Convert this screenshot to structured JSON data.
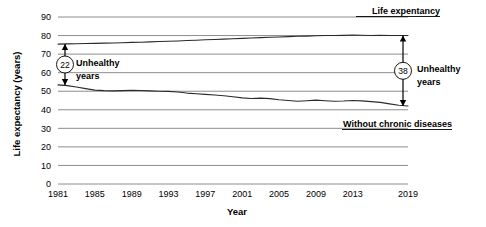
{
  "chart_data": {
    "type": "line",
    "title": "",
    "xlabel": "Year",
    "ylabel": "Life expectancy (years)",
    "xlim": [
      1981,
      2019
    ],
    "ylim": [
      0,
      90
    ],
    "grid": true,
    "legend_position": "inline-labels",
    "y_ticks": [
      0,
      10,
      20,
      30,
      40,
      50,
      60,
      70,
      80,
      90
    ],
    "x_ticks": [
      1981,
      1985,
      1989,
      1993,
      1997,
      2001,
      2005,
      2009,
      2013,
      2019
    ],
    "x_tick_labels": [
      "1981",
      "1985",
      "1989",
      "1993",
      "1997",
      "2001",
      "2005",
      "2009",
      "2013",
      "2019"
    ],
    "y_tick_labels": [
      "0",
      "10",
      "20",
      "30",
      "40",
      "50",
      "60",
      "70",
      "80",
      "90"
    ],
    "x": [
      1981,
      1982,
      1983,
      1984,
      1985,
      1986,
      1987,
      1988,
      1989,
      1990,
      1991,
      1992,
      1993,
      1994,
      1995,
      1996,
      1997,
      1998,
      1999,
      2000,
      2001,
      2002,
      2003,
      2004,
      2005,
      2006,
      2007,
      2008,
      2009,
      2010,
      2011,
      2012,
      2013,
      2014,
      2015,
      2016,
      2017,
      2018,
      2019
    ],
    "series": [
      {
        "name": "Life expentancy",
        "label": "Life expentancy",
        "color": "#2b2b2b",
        "values": [
          75.4,
          75.5,
          75.6,
          75.7,
          75.8,
          75.9,
          76.0,
          76.1,
          76.3,
          76.4,
          76.6,
          76.8,
          76.9,
          77.1,
          77.3,
          77.5,
          77.7,
          77.9,
          78.1,
          78.3,
          78.5,
          78.7,
          78.9,
          79.1,
          79.2,
          79.4,
          79.6,
          79.7,
          79.9,
          80.0,
          80.0,
          80.1,
          80.3,
          80.2,
          80.0,
          80.1,
          80.0,
          80.0,
          80.0
        ]
      },
      {
        "name": "Without chronic diseases",
        "label": "Without chronic diseases",
        "color": "#2b2b2b",
        "values": [
          53.4,
          53.0,
          52.3,
          51.4,
          50.6,
          50.3,
          50.2,
          50.3,
          50.5,
          50.4,
          50.2,
          50.0,
          49.9,
          49.6,
          49.0,
          48.6,
          48.3,
          48.0,
          47.6,
          47.0,
          46.4,
          46.1,
          46.3,
          46.0,
          45.4,
          45.0,
          44.6,
          44.9,
          45.2,
          44.9,
          44.6,
          44.7,
          45.0,
          44.8,
          44.4,
          44.0,
          43.2,
          42.4,
          42.0
        ]
      }
    ],
    "annotations": [
      {
        "name": "unhealthy-years-1981",
        "value": "22",
        "label_line1": "Unhealthy",
        "label_line2": "years",
        "at_year": 1981,
        "from": 53.4,
        "to": 75.4,
        "side": "left"
      },
      {
        "name": "unhealthy-years-2019",
        "value": "38",
        "label_line1": "Unhealthy",
        "label_line2": "years",
        "at_year": 2019,
        "from": 42.0,
        "to": 80.0,
        "side": "right"
      }
    ]
  }
}
